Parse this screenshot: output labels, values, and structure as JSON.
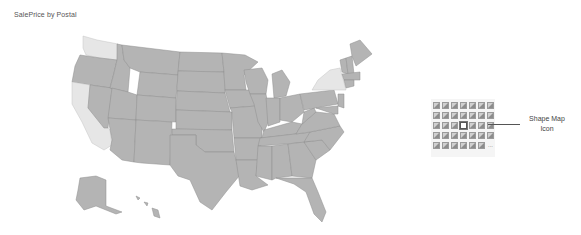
{
  "visual": {
    "title": "SalePrice by Postal",
    "type": "Shape Map",
    "colors": {
      "high": "#b4b4b4",
      "low": "#e6e6e6",
      "border": "#8f8f8f",
      "panel_bg": "#f5f5f5"
    },
    "highlighted_states": [
      "Washington",
      "California",
      "New York"
    ]
  },
  "visualizations_pane": {
    "rows": 5,
    "columns": 7,
    "highlighted_icon": "shape-map-icon",
    "more_label": "..."
  },
  "callout": {
    "line1": "Shape Map",
    "line2": "Icon"
  }
}
